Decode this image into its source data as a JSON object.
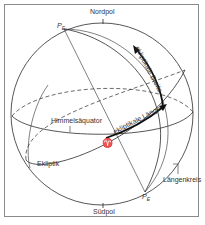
{
  "diagram": {
    "labels": {
      "north_pole": "Nordpol",
      "south_pole": "Südpol",
      "pole_top": "P",
      "pole_top_sub": "E",
      "pole_bottom": "P",
      "pole_bottom_sub": "E",
      "ecliptic_latitude": "ekliptikale Breite",
      "ecliptic_longitude": "ekliptikale Länge",
      "celestial_equator": "Himmelsäquator",
      "ecliptic": "Ekliptik",
      "meridian": "Längenkreis",
      "vernal_point": "♈"
    },
    "colors": {
      "line": "#2b2b2b",
      "frame": "#8a8a8a",
      "text": "#333333"
    }
  }
}
